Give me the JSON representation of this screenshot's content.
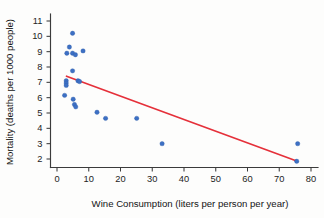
{
  "chart_data": {
    "type": "scatter",
    "title": "",
    "xlabel": "Wine Consumption (liters per person per year)",
    "ylabel": "Mortality (deaths per 1000 people)",
    "xlim": [
      0,
      80
    ],
    "ylim": [
      1.4,
      11.4
    ],
    "xticks": [
      0,
      10,
      20,
      30,
      40,
      50,
      60,
      70,
      80
    ],
    "yticks": [
      2,
      3,
      4,
      5,
      6,
      7,
      8,
      9,
      10,
      11
    ],
    "xtick_labels": [
      "0",
      "10",
      "20",
      "30",
      "40",
      "50",
      "60",
      "70",
      "80"
    ],
    "ytick_labels": [
      "2",
      "3",
      "4",
      "5",
      "6",
      "7",
      "8",
      "9",
      "10",
      "11"
    ],
    "grid": false,
    "legend": null,
    "marker_color": "#3d70c4",
    "trend_color": "#e5303a",
    "axis_color": "#3b3b3b",
    "points": [
      {
        "x": 4.9,
        "y": 10.2
      },
      {
        "x": 3.9,
        "y": 9.3
      },
      {
        "x": 3.1,
        "y": 8.9
      },
      {
        "x": 4.9,
        "y": 8.9
      },
      {
        "x": 5.8,
        "y": 8.8
      },
      {
        "x": 8.2,
        "y": 9.05
      },
      {
        "x": 4.9,
        "y": 7.75
      },
      {
        "x": 2.9,
        "y": 7.1
      },
      {
        "x": 2.9,
        "y": 6.95
      },
      {
        "x": 6.6,
        "y": 7.1
      },
      {
        "x": 7.1,
        "y": 7.05
      },
      {
        "x": 2.9,
        "y": 6.8
      },
      {
        "x": 2.4,
        "y": 6.15
      },
      {
        "x": 5.1,
        "y": 5.9
      },
      {
        "x": 5.5,
        "y": 5.55
      },
      {
        "x": 5.9,
        "y": 5.4
      },
      {
        "x": 12.6,
        "y": 5.05
      },
      {
        "x": 15.3,
        "y": 4.65
      },
      {
        "x": 25.1,
        "y": 4.65
      },
      {
        "x": 33.1,
        "y": 3.0
      },
      {
        "x": 75.8,
        "y": 3.0
      },
      {
        "x": 75.5,
        "y": 1.85
      }
    ],
    "trend_line": {
      "x0": 3.0,
      "y0": 7.4,
      "x1": 75.7,
      "y1": 1.85,
      "description": "negative linear fit"
    }
  }
}
